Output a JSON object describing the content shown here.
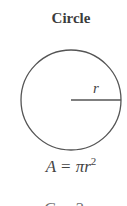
{
  "diagram": {
    "title": "Circle",
    "radius_label": "r",
    "formula": {
      "lhs": "A",
      "equals": "=",
      "rhs_base": "πr",
      "rhs_exponent": "2"
    },
    "next_formula_partial": "C = 2πr",
    "colors": {
      "stroke": "#555555",
      "text": "#3c3c3c",
      "background": "#ffffff"
    },
    "shape": {
      "type": "circle",
      "center": [
        71,
        100
      ],
      "radius": 50
    }
  }
}
